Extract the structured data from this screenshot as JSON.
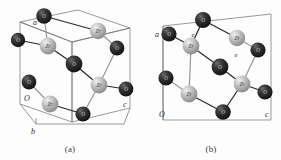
{
  "figure": {
    "background_color": "#fdfdfd",
    "panels": [
      {
        "id": "a",
        "caption": "(a)",
        "axis_labels": {
          "origin": "O",
          "a": "a",
          "b": "b",
          "c": "c"
        },
        "site_labels": [],
        "atoms": [
          {
            "element": "O",
            "label": "O",
            "type": "dark",
            "cx": 44,
            "cy": 16,
            "r": 7.8
          },
          {
            "element": "Zr",
            "label": "Zr",
            "type": "light",
            "cx": 98,
            "cy": 31,
            "r": 8.2
          },
          {
            "element": "O",
            "label": "O",
            "type": "dark",
            "cx": 18,
            "cy": 40,
            "r": 7.2
          },
          {
            "element": "Zr",
            "label": "Zr",
            "type": "light",
            "cx": 48,
            "cy": 46,
            "r": 8.4
          },
          {
            "element": "O",
            "label": "O",
            "type": "dark",
            "cx": 117,
            "cy": 48,
            "r": 7.4
          },
          {
            "element": "O",
            "label": "O",
            "type": "dark",
            "cx": 74,
            "cy": 64,
            "r": 8.4
          },
          {
            "element": "O",
            "label": "O",
            "type": "dark",
            "cx": 29,
            "cy": 82,
            "r": 7.4
          },
          {
            "element": "Zr",
            "label": "Zr",
            "type": "light",
            "cx": 99,
            "cy": 85,
            "r": 8.4
          },
          {
            "element": "O",
            "label": "O",
            "type": "dark",
            "cx": 126,
            "cy": 89,
            "r": 7.4
          },
          {
            "element": "Zr",
            "label": "Zr",
            "type": "light",
            "cx": 50,
            "cy": 104,
            "r": 8.4
          },
          {
            "element": "O",
            "label": "O",
            "type": "dark",
            "cx": 83,
            "cy": 114,
            "r": 7.6
          }
        ],
        "bonds": [
          {
            "x1": 44,
            "y1": 16,
            "x2": 98,
            "y2": 31,
            "shade": "dark"
          },
          {
            "x1": 44,
            "y1": 16,
            "x2": 48,
            "y2": 46,
            "shade": "light"
          },
          {
            "x1": 18,
            "y1": 40,
            "x2": 48,
            "y2": 46,
            "shade": "dark"
          },
          {
            "x1": 48,
            "y1": 46,
            "x2": 74,
            "y2": 64,
            "shade": "dark"
          },
          {
            "x1": 74,
            "y1": 64,
            "x2": 99,
            "y2": 85,
            "shade": "dark"
          },
          {
            "x1": 99,
            "y1": 85,
            "x2": 126,
            "y2": 89,
            "shade": "dark"
          },
          {
            "x1": 99,
            "y1": 85,
            "x2": 117,
            "y2": 48,
            "shade": "light"
          },
          {
            "x1": 98,
            "y1": 31,
            "x2": 117,
            "y2": 48,
            "shade": "light"
          },
          {
            "x1": 50,
            "y1": 104,
            "x2": 83,
            "y2": 114,
            "shade": "dark"
          },
          {
            "x1": 83,
            "y1": 114,
            "x2": 99,
            "y2": 85,
            "shade": "light"
          },
          {
            "x1": 29,
            "y1": 82,
            "x2": 50,
            "y2": 104,
            "shade": "light"
          }
        ]
      },
      {
        "id": "b",
        "caption": "(b)",
        "axis_labels": {
          "origin": "O",
          "a": "a",
          "c": "c"
        },
        "site_labels": [
          {
            "text": "e",
            "x": 52,
            "y": 35
          },
          {
            "text": "e",
            "x": 95,
            "y": 55
          }
        ],
        "atoms": [
          {
            "element": "O",
            "label": "O",
            "type": "dark",
            "cx": 62,
            "cy": 20,
            "r": 8.0
          },
          {
            "element": "O",
            "label": "O",
            "type": "dark",
            "cx": 28,
            "cy": 34,
            "r": 7.6
          },
          {
            "element": "Zr",
            "label": "Zr",
            "type": "light",
            "cx": 96,
            "cy": 38,
            "r": 8.2
          },
          {
            "element": "Zr",
            "label": "Zr",
            "type": "light",
            "cx": 50,
            "cy": 46,
            "r": 8.4
          },
          {
            "element": "O",
            "label": "O",
            "type": "dark",
            "cx": 117,
            "cy": 50,
            "r": 7.6
          },
          {
            "element": "O",
            "label": "O",
            "type": "dark",
            "cx": 79,
            "cy": 67,
            "r": 8.4
          },
          {
            "element": "O",
            "label": "O",
            "type": "dark",
            "cx": 25,
            "cy": 78,
            "r": 7.6
          },
          {
            "element": "Zr",
            "label": "Zr",
            "type": "light",
            "cx": 101,
            "cy": 84,
            "r": 8.4
          },
          {
            "element": "O",
            "label": "O",
            "type": "dark",
            "cx": 124,
            "cy": 92,
            "r": 7.6
          },
          {
            "element": "Zr",
            "label": "Zr",
            "type": "light",
            "cx": 48,
            "cy": 94,
            "r": 8.4
          },
          {
            "element": "O",
            "label": "O",
            "type": "dark",
            "cx": 82,
            "cy": 112,
            "r": 7.8
          }
        ],
        "bonds": [
          {
            "x1": 62,
            "y1": 20,
            "x2": 96,
            "y2": 38,
            "shade": "dark"
          },
          {
            "x1": 62,
            "y1": 20,
            "x2": 50,
            "y2": 46,
            "shade": "dark"
          },
          {
            "x1": 28,
            "y1": 34,
            "x2": 50,
            "y2": 46,
            "shade": "dark"
          },
          {
            "x1": 50,
            "y1": 46,
            "x2": 79,
            "y2": 67,
            "shade": "dark"
          },
          {
            "x1": 79,
            "y1": 67,
            "x2": 101,
            "y2": 84,
            "shade": "dark"
          },
          {
            "x1": 96,
            "y1": 38,
            "x2": 117,
            "y2": 50,
            "shade": "light"
          },
          {
            "x1": 101,
            "y1": 84,
            "x2": 124,
            "y2": 92,
            "shade": "dark"
          },
          {
            "x1": 101,
            "y1": 84,
            "x2": 117,
            "y2": 50,
            "shade": "light"
          },
          {
            "x1": 48,
            "y1": 94,
            "x2": 82,
            "y2": 112,
            "shade": "dark"
          },
          {
            "x1": 82,
            "y1": 112,
            "x2": 101,
            "y2": 84,
            "shade": "dark"
          },
          {
            "x1": 25,
            "y1": 78,
            "x2": 48,
            "y2": 94,
            "shade": "light"
          },
          {
            "x1": 50,
            "y1": 46,
            "x2": 48,
            "y2": 94,
            "shade": "light"
          }
        ]
      }
    ],
    "legend": {
      "dark_atom_element": "O",
      "light_atom_element": "Zr"
    },
    "colors": {
      "dark_atom": "#262626",
      "light_atom": "#b9b9b9",
      "cell_edge": "#6f6f6f",
      "bond_dark": "#2a2a2a",
      "bond_light": "#9a9a9a",
      "text": "#2b2b2b"
    }
  }
}
